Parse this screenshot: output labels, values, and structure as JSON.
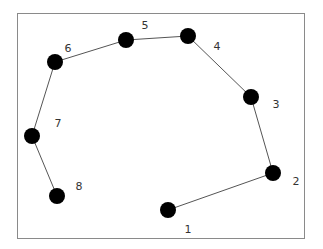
{
  "diagram": {
    "type": "path-graph",
    "node_color": "#000000",
    "edge_color": "#555555",
    "border_color": "#8a8a8a",
    "nodes": [
      {
        "id": "1",
        "label": "1",
        "x": 168,
        "y": 210,
        "lx": 188,
        "ly": 229
      },
      {
        "id": "2",
        "label": "2",
        "x": 273,
        "y": 173,
        "lx": 296,
        "ly": 181
      },
      {
        "id": "3",
        "label": "3",
        "x": 251,
        "y": 97,
        "lx": 276,
        "ly": 104
      },
      {
        "id": "4",
        "label": "4",
        "x": 188,
        "y": 36,
        "lx": 217,
        "ly": 46
      },
      {
        "id": "5",
        "label": "5",
        "x": 126,
        "y": 40,
        "lx": 145,
        "ly": 25
      },
      {
        "id": "6",
        "label": "6",
        "x": 55,
        "y": 62,
        "lx": 68,
        "ly": 48
      },
      {
        "id": "7",
        "label": "7",
        "x": 32,
        "y": 136,
        "lx": 58,
        "ly": 123
      },
      {
        "id": "8",
        "label": "8",
        "x": 57,
        "y": 196,
        "lx": 79,
        "ly": 186
      }
    ],
    "edges": [
      [
        "1",
        "2"
      ],
      [
        "2",
        "3"
      ],
      [
        "3",
        "4"
      ],
      [
        "4",
        "5"
      ],
      [
        "5",
        "6"
      ],
      [
        "6",
        "7"
      ],
      [
        "7",
        "8"
      ]
    ]
  }
}
